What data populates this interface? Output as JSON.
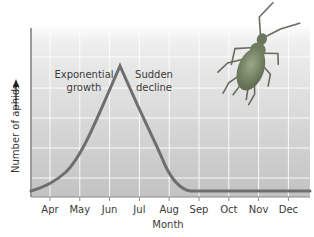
{
  "chart_data": {
    "type": "line",
    "title": "",
    "xlabel": "Month",
    "ylabel": "Number of aphids",
    "categories": [
      "Apr",
      "May",
      "Jun",
      "Jul",
      "Aug",
      "Sep",
      "Oct",
      "Nov",
      "Dec"
    ],
    "series": [
      {
        "name": "Aphid population",
        "x": [
          "Mar (start)",
          "Apr",
          "May",
          "Jun",
          "mid-Jun (peak)",
          "Jul",
          "Aug",
          "Sep",
          "Oct",
          "Nov",
          "Dec",
          "end"
        ],
        "values": [
          3,
          9,
          28,
          60,
          100,
          70,
          30,
          5,
          5,
          5,
          5,
          5
        ]
      }
    ],
    "ylim": [
      0,
      100
    ],
    "y_ticks_labeled": false,
    "grid": true,
    "legend": "none",
    "annotations": [
      {
        "text_line1": "Exponential",
        "text_line2": "growth",
        "position": "left of peak"
      },
      {
        "text_line1": "Sudden",
        "text_line2": "decline",
        "position": "right of peak"
      }
    ],
    "y_axis_arrow": "up",
    "illustration": "aphid insect (top right)",
    "colors": {
      "line": "#6e6e6e",
      "plot_bg_top": "#f2f2f2",
      "plot_bg_bottom": "#c4c4c4",
      "grid": "#ffffff",
      "axis": "#8a8a8a",
      "aphid": "#7a8a68"
    }
  }
}
